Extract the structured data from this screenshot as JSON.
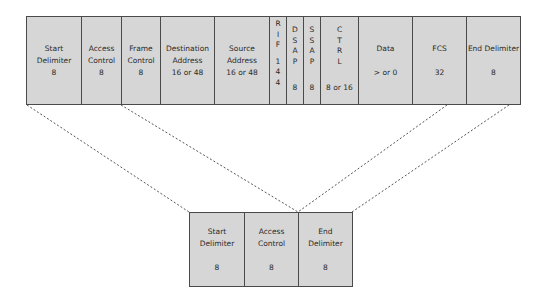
{
  "top_frame": {
    "fields": [
      {
        "name": "Start Delimiter",
        "line1": "Start",
        "line2": "Delimiter",
        "bits": "8"
      },
      {
        "name": "Access Control",
        "line1": "Access",
        "line2": "Control",
        "bits": "8"
      },
      {
        "name": "Frame Control",
        "line1": "Frame",
        "line2": "Control",
        "bits": "8"
      },
      {
        "name": "Destination Address",
        "line1": "Destination",
        "line2": "Address",
        "bits": "16 or 48"
      },
      {
        "name": "Source Address",
        "line1": "Source",
        "line2": "Address",
        "bits": "16 or 48"
      },
      {
        "name": "RIF",
        "letters": [
          "R",
          "I",
          "F"
        ],
        "bits_digits": [
          "1",
          "4",
          "4"
        ]
      },
      {
        "name": "DSAP",
        "letters": [
          "D",
          "S",
          "A",
          "P"
        ],
        "bits": "8"
      },
      {
        "name": "SSAP",
        "letters": [
          "S",
          "S",
          "A",
          "P"
        ],
        "bits": "8"
      },
      {
        "name": "CTRL",
        "letters": [
          "C",
          "T",
          "R",
          "L"
        ],
        "bits": "8 or 16"
      },
      {
        "name": "Data",
        "line1": "Data",
        "bits": "> or 0"
      },
      {
        "name": "FCS",
        "line1": "FCS",
        "bits": "32"
      },
      {
        "name": "End Delimiter",
        "line1": "End Delimiter",
        "bits": "8"
      }
    ]
  },
  "bottom_frame": {
    "fields": [
      {
        "name": "Start Delimiter",
        "line1": "Start",
        "line2": "Delimiter",
        "bits": "8"
      },
      {
        "name": "Access Control",
        "line1": "Access",
        "line2": "Control",
        "bits": "8"
      },
      {
        "name": "End Delimiter",
        "line1": "End",
        "line2": "Delimiter",
        "bits": "8"
      }
    ]
  },
  "colors": {
    "fill": "#d6d6d6",
    "border": "#4a4a4a",
    "dash": "#555555"
  }
}
